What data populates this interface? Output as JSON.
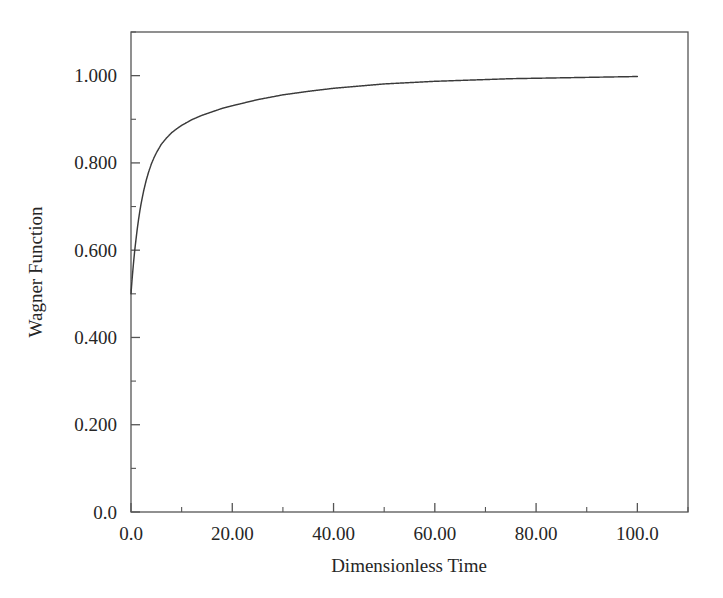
{
  "chart_data": {
    "type": "line",
    "title": "",
    "xlabel": "Dimensionless Time",
    "ylabel": "Wagner Function",
    "xlim": [
      0,
      110
    ],
    "ylim": [
      0,
      1.1
    ],
    "grid": false,
    "legend": null,
    "x_major_ticks": [
      0,
      20,
      40,
      60,
      80,
      100
    ],
    "x_major_tick_labels": [
      "0.0",
      "20.00",
      "40.00",
      "60.00",
      "80.00",
      "100.0"
    ],
    "x_minor_ticks": [
      10,
      30,
      50,
      70,
      90,
      110
    ],
    "y_major_ticks": [
      0.0,
      0.2,
      0.4,
      0.6,
      0.8,
      1.0
    ],
    "y_major_tick_labels": [
      "0.0",
      "0.200",
      "0.400",
      "0.600",
      "0.800",
      "1.000"
    ],
    "y_minor_ticks": [
      0.1,
      0.3,
      0.5,
      0.7,
      0.9,
      1.1
    ],
    "line_color": "#3a3a3a",
    "series": [
      {
        "name": "Wagner Function",
        "x": [
          0,
          0.1,
          0.2,
          0.3,
          0.4,
          0.5,
          0.6,
          0.7,
          0.8,
          0.9,
          1.0,
          1.25,
          1.5,
          1.75,
          2.0,
          2.5,
          3.0,
          3.5,
          4.0,
          4.5,
          5.0,
          6.0,
          7.0,
          8.0,
          9.0,
          10.0,
          12.0,
          14.0,
          16.0,
          18.0,
          20.0,
          25.0,
          30.0,
          35.0,
          40.0,
          45.0,
          50.0,
          55.0,
          60.0,
          65.0,
          70.0,
          75.0,
          80.0,
          85.0,
          90.0,
          95.0,
          100.0
        ],
        "y": [
          0.5,
          0.516,
          0.531,
          0.545,
          0.558,
          0.571,
          0.583,
          0.595,
          0.606,
          0.616,
          0.626,
          0.65,
          0.671,
          0.69,
          0.707,
          0.736,
          0.76,
          0.78,
          0.797,
          0.811,
          0.823,
          0.843,
          0.857,
          0.869,
          0.878,
          0.886,
          0.899,
          0.909,
          0.917,
          0.925,
          0.931,
          0.945,
          0.956,
          0.964,
          0.971,
          0.976,
          0.981,
          0.984,
          0.987,
          0.989,
          0.991,
          0.993,
          0.994,
          0.995,
          0.996,
          0.997,
          0.998
        ]
      }
    ],
    "formula_note": "Wagner indicial function, starts at 0.5 and asymptotes to 1.0"
  },
  "axes": {
    "y_title": "Wagner Function",
    "x_title": "Dimensionless Time"
  }
}
